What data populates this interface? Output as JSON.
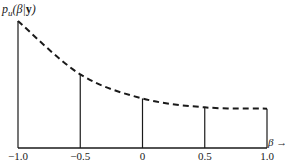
{
  "chart_data": {
    "type": "line",
    "title": "",
    "ylabel_parts": {
      "p": "p",
      "sub": "u",
      "open": "(",
      "beta": "β",
      "bar": "|",
      "y": "y",
      "close": ")"
    },
    "ylabel": "p_u(β|y)",
    "xlabel": "β →",
    "x": [
      -1.0,
      -0.5,
      0.0,
      0.5,
      1.0
    ],
    "tick_labels": [
      "−1.0",
      "−0.5",
      "0",
      "0.5",
      "1.0"
    ],
    "series": [
      {
        "name": "p_u(β|y)",
        "style": "dashed",
        "values": [
          1.0,
          0.58,
          0.39,
          0.32,
          0.31
        ]
      }
    ],
    "ordinates": "vertical solid lines drawn from axis to curve at each tick",
    "xlim": [
      -1.0,
      1.0
    ],
    "ylim": [
      0,
      1.0
    ],
    "grid": false,
    "legend": "none",
    "y_ticks": "none (unlabeled)"
  }
}
